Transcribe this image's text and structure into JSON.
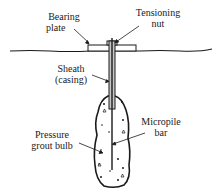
{
  "diagram": {
    "labels": {
      "bearing_plate_line1": "Bearing",
      "bearing_plate_line2": "plate",
      "tensioning_nut_line1": "Tensioning",
      "tensioning_nut_line2": "nut",
      "sheath_line1": "Sheath",
      "sheath_line2": "(casing)",
      "micropile_bar_line1": "Micropile",
      "micropile_bar_line2": "bar",
      "grout_bulb_line1": "Pressure",
      "grout_bulb_line2": "grout bulb"
    },
    "colors": {
      "line": "#1a1a1a",
      "sheath_fill": "#c8c8c8",
      "background": "#ffffff"
    }
  }
}
